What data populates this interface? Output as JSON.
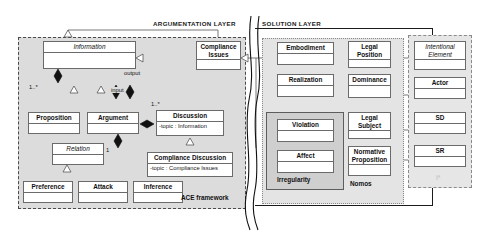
{
  "diagram": {
    "layers": [
      {
        "id": "argumentation",
        "label": "ARGUMENTATION LAYER"
      },
      {
        "id": "solution",
        "label": "SOLUTION LAYER"
      }
    ],
    "groups": [
      {
        "id": "ace",
        "label": "ACE framework"
      },
      {
        "id": "irregularity",
        "label": "Irregularity"
      },
      {
        "id": "nomos",
        "label": "Nomos"
      },
      {
        "id": "istar",
        "label": "i*"
      }
    ],
    "classes": [
      {
        "id": "information",
        "name": "Information",
        "abstract": true,
        "attributes": ""
      },
      {
        "id": "compliance-issues",
        "name": "Compliance\nIssues",
        "abstract": false,
        "attributes": ""
      },
      {
        "id": "proposition",
        "name": "Proposition",
        "abstract": false,
        "attributes": ""
      },
      {
        "id": "argument",
        "name": "Argument",
        "abstract": false,
        "attributes": ""
      },
      {
        "id": "discussion",
        "name": "Discussion",
        "abstract": false,
        "attributes": "-topic : Information"
      },
      {
        "id": "relation",
        "name": "Relation",
        "abstract": true,
        "attributes": ""
      },
      {
        "id": "compliance-discussion",
        "name": "Compliance Discussion",
        "abstract": false,
        "attributes": "-topic : Compliance Issues"
      },
      {
        "id": "preference",
        "name": "Preference",
        "abstract": false,
        "attributes": ""
      },
      {
        "id": "attack",
        "name": "Attack",
        "abstract": false,
        "attributes": ""
      },
      {
        "id": "inference",
        "name": "Inference",
        "abstract": false,
        "attributes": ""
      },
      {
        "id": "embodiment",
        "name": "Embodiment",
        "abstract": false,
        "attributes": ""
      },
      {
        "id": "realization",
        "name": "Realization",
        "abstract": false,
        "attributes": ""
      },
      {
        "id": "violation",
        "name": "Violation",
        "abstract": false,
        "attributes": ""
      },
      {
        "id": "affect",
        "name": "Affect",
        "abstract": false,
        "attributes": ""
      },
      {
        "id": "legal-position",
        "name": "Legal\nPosition",
        "abstract": false,
        "attributes": ""
      },
      {
        "id": "dominance",
        "name": "Dominance",
        "abstract": false,
        "attributes": ""
      },
      {
        "id": "legal-subject",
        "name": "Legal\nSubject",
        "abstract": false,
        "attributes": ""
      },
      {
        "id": "normative-proposition",
        "name": "Normative\nProposition",
        "abstract": false,
        "attributes": ""
      },
      {
        "id": "intentional-element",
        "name": "Intentional\nElement",
        "abstract": true,
        "attributes": ""
      },
      {
        "id": "actor",
        "name": "Actor",
        "abstract": false,
        "attributes": ""
      },
      {
        "id": "sd",
        "name": "SD",
        "abstract": false,
        "attributes": ""
      },
      {
        "id": "sr",
        "name": "SR",
        "abstract": false,
        "attributes": ""
      }
    ],
    "edge_labels": [
      {
        "id": "output",
        "text": "output"
      },
      {
        "id": "input",
        "text": "input"
      },
      {
        "id": "mult-info",
        "text": "1..*"
      },
      {
        "id": "mult-disc",
        "text": "1..*"
      },
      {
        "id": "mult-rel",
        "text": "1"
      }
    ],
    "colors": {
      "page_background": "#ffffff",
      "layer_fill": "#dcdcdc",
      "group_fill_nomos": "#e4e4e4",
      "group_fill_istar": "#e6e6e6",
      "group_fill_irregularity": "#cfcfcf",
      "class_fill": "#ffffff",
      "line": "#6a6a6a",
      "frame": "#1b1b1b",
      "text": "#111111"
    }
  }
}
